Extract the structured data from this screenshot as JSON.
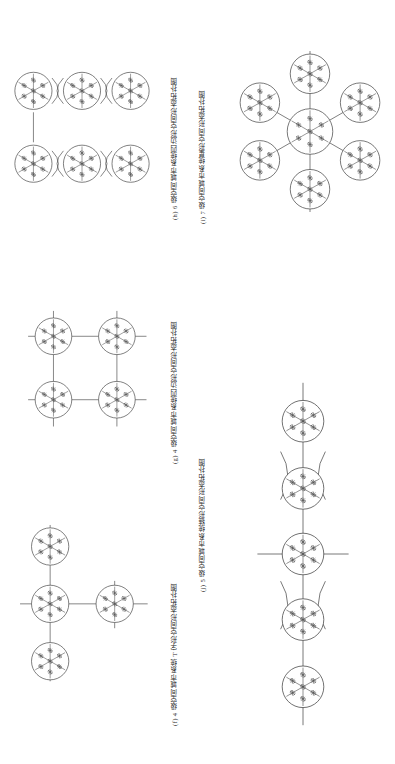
{
  "page": {
    "orientation": "rotated-90-ccw",
    "background": "#ffffff",
    "ink": "#3a3a3a",
    "width": 395,
    "height": 764
  },
  "figure": {
    "kind": "topology-diagram-sheet",
    "node_glyph": "spatial-city-node",
    "node_description": "circle with six radial spokes, each spoke tipped with a small snowflake/asterisk mark",
    "panels": [
      {
        "id": "f",
        "label": "(f)",
        "caption": "(f) 4 级空间城市系统 T 字形空间形态拓扑图",
        "topology": "T-shape",
        "level": 4,
        "node_count": 4,
        "nodes": [
          {
            "name": "top",
            "cx": 56,
            "cy": 42
          },
          {
            "name": "center",
            "cx": 56,
            "cy": 122
          },
          {
            "name": "bottom",
            "cx": 56,
            "cy": 202
          },
          {
            "name": "right",
            "cx": 146,
            "cy": 122
          }
        ],
        "edges": [
          {
            "from": "top",
            "to": "center"
          },
          {
            "from": "center",
            "to": "bottom"
          },
          {
            "from": "center",
            "to": "right"
          }
        ]
      },
      {
        "id": "g",
        "label": "(g)",
        "caption": "(g) 4 级空间城市系统四边形空间形态拓扑图",
        "topology": "quadrilateral",
        "level": 4,
        "node_count": 4,
        "nodes": [
          {
            "name": "top-left",
            "cx": 56,
            "cy": 62
          },
          {
            "name": "top-right",
            "cx": 146,
            "cy": 62
          },
          {
            "name": "bottom-left",
            "cx": 56,
            "cy": 152
          },
          {
            "name": "bottom-right",
            "cx": 146,
            "cy": 152
          }
        ],
        "edges": [
          {
            "from": "top-left",
            "to": "top-right"
          },
          {
            "from": "bottom-left",
            "to": "bottom-right"
          },
          {
            "from": "top-left",
            "to": "bottom-left"
          },
          {
            "from": "top-right",
            "to": "bottom-right"
          }
        ]
      },
      {
        "id": "h",
        "label": "(h)",
        "caption": "(h) 6 级空间城市系统四边形空间形态拓扑图",
        "topology": "quadrilateral-chain",
        "level": 6,
        "node_count": 6,
        "rows": 2,
        "cols": 3,
        "link_style": "lens/blended merge between adjacent nodes",
        "nodes": [
          {
            "name": "r1c1",
            "cx": 44,
            "cy": 48
          },
          {
            "name": "r1c2",
            "cx": 112,
            "cy": 48
          },
          {
            "name": "r1c3",
            "cx": 180,
            "cy": 48
          },
          {
            "name": "r2c1",
            "cx": 44,
            "cy": 150
          },
          {
            "name": "r2c2",
            "cx": 112,
            "cy": 150
          },
          {
            "name": "r2c3",
            "cx": 180,
            "cy": 150
          }
        ],
        "edges": [
          {
            "from": "r1c1",
            "to": "r1c2"
          },
          {
            "from": "r1c2",
            "to": "r1c3"
          },
          {
            "from": "r2c1",
            "to": "r2c2"
          },
          {
            "from": "r2c2",
            "to": "r2c3"
          },
          {
            "from": "r1c1",
            "to": "r2c1"
          }
        ]
      },
      {
        "id": "i",
        "label": "(i)",
        "caption": "(i) 7 级空间城市系统星形空间形态拓扑图",
        "topology": "star / radial hub-and-spoke",
        "level": 7,
        "node_count": 7,
        "hub": {
          "name": "hub",
          "cx": 108,
          "cy": 120
        },
        "satellites": [
          {
            "name": "n",
            "cx": 108,
            "cy": 44
          },
          {
            "name": "ne",
            "cx": 174,
            "cy": 82
          },
          {
            "name": "se",
            "cx": 174,
            "cy": 158
          },
          {
            "name": "s",
            "cx": 108,
            "cy": 196
          },
          {
            "name": "sw",
            "cx": 42,
            "cy": 158
          },
          {
            "name": "nw",
            "cx": 42,
            "cy": 82
          }
        ],
        "edges": [
          {
            "from": "hub",
            "to": "nw"
          },
          {
            "from": "hub",
            "to": "sw"
          },
          {
            "from": "hub",
            "to": "ne"
          },
          {
            "from": "hub",
            "to": "se"
          }
        ]
      },
      {
        "id": "j",
        "label": "(j)",
        "caption": "(j) 5 级空间城市系统链形空间形态拓扑图",
        "topology": "chain / linear",
        "level": 5,
        "node_count": 5,
        "link_style": "lens/blended merge between adjacent nodes",
        "nodes": [
          {
            "name": "p1",
            "cx": 44,
            "cy": 92
          },
          {
            "name": "p2",
            "cx": 112,
            "cy": 92
          },
          {
            "name": "p3",
            "cx": 180,
            "cy": 92
          },
          {
            "name": "p4",
            "cx": 248,
            "cy": 92
          },
          {
            "name": "p5",
            "cx": 316,
            "cy": 92
          }
        ],
        "edges": [
          {
            "from": "p1",
            "to": "p2"
          },
          {
            "from": "p2",
            "to": "p3"
          },
          {
            "from": "p3",
            "to": "p4"
          },
          {
            "from": "p4",
            "to": "p5"
          }
        ]
      }
    ]
  }
}
